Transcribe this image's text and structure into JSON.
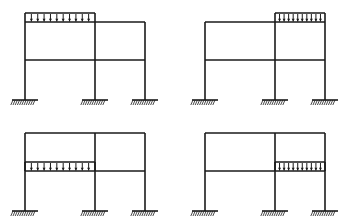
{
  "figure": {
    "type": "structural-frame-diagram",
    "background_color": "#ffffff",
    "line_color": "#1a1a1a",
    "panel_count": 4,
    "panel_grid": {
      "columns": 2,
      "rows": 2,
      "panel_width": 180,
      "panel_height": 111
    }
  },
  "geometry": {
    "note": "Coordinates are per-panel in an 180x111 local SVG space",
    "column_x": [
      25,
      95,
      145
    ],
    "roof_beam_y": 22,
    "floor_beam_y": 60,
    "base_y": 100,
    "support_plate_half_width": 13,
    "hatch_depth": 5,
    "line_width": 1.6,
    "load_band_height": 9,
    "load_arrow_count": 10
  },
  "supports": {
    "type": "fixed",
    "count_per_frame": 3,
    "label": "fixed-support",
    "icon": "hatched-base-plate"
  },
  "members": {
    "columns_label": "column",
    "roof_beam_label": "roof-beam",
    "floor_beam_label": "floor-beam"
  },
  "load": {
    "type": "uniformly-distributed-load",
    "direction": "downward",
    "icon": "down-arrow",
    "arrow_count": 10
  },
  "panels": [
    {
      "id": "a",
      "name": "panel-top-left",
      "position": {
        "x": 0,
        "y": 0
      },
      "loaded_member": "roof-beam",
      "loaded_bay": "left",
      "load_span": {
        "x1": 25,
        "x2": 95
      },
      "load_baseline_y": 22
    },
    {
      "id": "b",
      "name": "panel-top-right",
      "position": {
        "x": 180,
        "y": 0
      },
      "loaded_member": "roof-beam",
      "loaded_bay": "right",
      "load_span": {
        "x1": 95,
        "x2": 145
      },
      "load_baseline_y": 22
    },
    {
      "id": "c",
      "name": "panel-bottom-left",
      "position": {
        "x": 0,
        "y": 111
      },
      "loaded_member": "floor-beam",
      "loaded_bay": "left",
      "load_span": {
        "x1": 25,
        "x2": 95
      },
      "load_baseline_y": 60
    },
    {
      "id": "d",
      "name": "panel-bottom-right",
      "position": {
        "x": 180,
        "y": 111
      },
      "loaded_member": "floor-beam",
      "loaded_bay": "right",
      "load_span": {
        "x1": 95,
        "x2": 145
      },
      "load_baseline_y": 60
    }
  ]
}
